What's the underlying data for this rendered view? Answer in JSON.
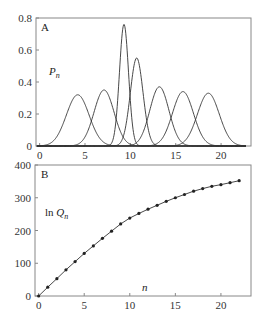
{
  "chart_data": [
    {
      "panel": "A",
      "type": "line",
      "ylabel": "P_n",
      "xlabel": "",
      "xlim": [
        -0.4,
        23.3
      ],
      "ylim": [
        0,
        0.8
      ],
      "xticks": [
        0,
        5,
        10,
        15,
        20
      ],
      "yticks": [
        0,
        0.2,
        0.4,
        0.6,
        0.8
      ],
      "ytick_labels": [
        "0",
        "0.2",
        "0.4",
        "0.6",
        "0.8"
      ],
      "grid": false,
      "series": [
        {
          "name": "peak1",
          "center": 4.2,
          "height": 0.32,
          "width": 1.25
        },
        {
          "name": "peak2",
          "center": 7.1,
          "height": 0.35,
          "width": 1.1
        },
        {
          "name": "peak3",
          "center": 9.3,
          "height": 0.76,
          "width": 0.5
        },
        {
          "name": "peak4",
          "center": 10.7,
          "height": 0.55,
          "width": 0.7
        },
        {
          "name": "peak5",
          "center": 13.2,
          "height": 0.37,
          "width": 1.05
        },
        {
          "name": "peak6",
          "center": 15.8,
          "height": 0.34,
          "width": 1.15
        },
        {
          "name": "peak7",
          "center": 18.6,
          "height": 0.33,
          "width": 1.2
        }
      ]
    },
    {
      "panel": "B",
      "type": "line",
      "ylabel": "ln Q_n",
      "xlabel": "n",
      "xlim": [
        -0.4,
        23.3
      ],
      "ylim": [
        0,
        400
      ],
      "xticks": [
        0,
        5,
        10,
        15,
        20
      ],
      "yticks": [
        0,
        100,
        200,
        300,
        400
      ],
      "grid": false,
      "x": [
        0,
        1,
        2,
        3,
        4,
        5,
        6,
        7,
        8,
        9,
        10,
        11,
        12,
        13,
        14,
        15,
        16,
        17,
        18,
        19,
        20,
        21,
        22
      ],
      "values": [
        0,
        27,
        53,
        80,
        105,
        130,
        153,
        176,
        198,
        220,
        238,
        252,
        265,
        277,
        289,
        300,
        310,
        320,
        328,
        335,
        340,
        346,
        352
      ]
    }
  ],
  "panels": {
    "a": {
      "letter": "A",
      "ylabel_main": "P",
      "ylabel_sub": "n"
    },
    "b": {
      "letter": "B",
      "ylabel_prefix": "ln ",
      "ylabel_main": "Q",
      "ylabel_sub": "n",
      "xlabel": "n"
    }
  },
  "colors": {
    "line": "#333333",
    "frame": "#888888",
    "marker": "#222222"
  }
}
